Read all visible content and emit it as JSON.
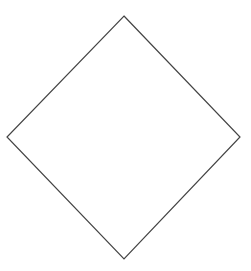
{
  "diagram": {
    "shape": "diamond",
    "stroke_color": "#444444",
    "fill_color": "#ffffff",
    "stroke_width": 1.2,
    "points": [
      [
        124,
        16
      ],
      [
        240,
        137
      ],
      [
        124,
        259
      ],
      [
        7,
        137
      ]
    ]
  }
}
